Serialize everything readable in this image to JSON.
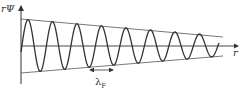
{
  "diagram": {
    "title": "",
    "y_axis_label": "rΨ",
    "x_axis_label": "r",
    "wavelength_label": "λ",
    "wavelength_subscript": "F",
    "curve": "damped sinusoidal oscillation with linearly decaying envelope",
    "colors": {
      "line": "#333333",
      "background": "#ffffff"
    }
  },
  "chart_data": {
    "type": "line",
    "title": "",
    "xlabel": "r",
    "ylabel": "rΨ",
    "annotations": [
      "λF (wavelength marker, double-headed arrow spanning one period)"
    ],
    "series": [
      {
        "name": "rΨ(r)",
        "description": "oscillation ~8 periods, amplitude decays from ~27px to ~10px"
      },
      {
        "name": "upper envelope",
        "description": "straight line decreasing"
      },
      {
        "name": "lower envelope",
        "description": "straight line increasing"
      }
    ],
    "grid": false
  }
}
